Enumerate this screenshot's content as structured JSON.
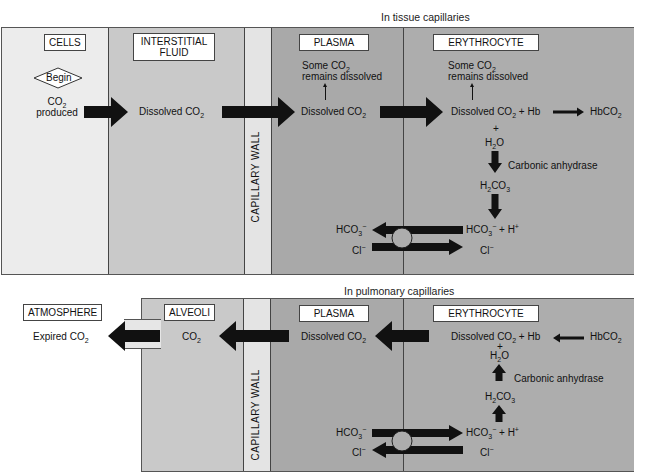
{
  "tissue": {
    "caption": "In tissue capillaries",
    "columns": {
      "cells": "CELLS",
      "interstitial_line1": "INTERSTITIAL",
      "interstitial_line2": "FLUID",
      "wall": "CAPILLARY WALL",
      "plasma": "PLASMA",
      "erythrocyte": "ERYTHROCYTE"
    },
    "begin": "Begin",
    "co2_produced_line1": "CO",
    "co2_produced_sub": "2",
    "co2_produced_line2": "produced",
    "interstitial_text": "Dissolved CO",
    "interstitial_sub": "2",
    "plasma_note_line1": "Some CO",
    "plasma_note_sub": "2",
    "plasma_note_line2": "remains dissolved",
    "plasma_text": "Dissolved CO",
    "plasma_sub": "2",
    "ery_note_line1": "Some CO",
    "ery_note_sub": "2",
    "ery_note_line2": "remains dissolved",
    "ery_reaction_a": "Dissolved CO",
    "ery_reaction_sub": "2",
    "ery_reaction_b": " + Hb",
    "hbco2": "HbCO",
    "hbco2_sub": "2",
    "plus": "+",
    "h2o_a": "H",
    "h2o_sub": "2",
    "h2o_b": "O",
    "enzyme": "Carbonic anhydrase",
    "h2co3_a": "H",
    "h2co3_sub1": "2",
    "h2co3_b": "CO",
    "h2co3_sub2": "3",
    "hco3_ery_a": "HCO",
    "hco3_ery_sub": "3",
    "hco3_ery_sup": "−",
    "hplus": " + H",
    "hplus_sup": "+",
    "hco3_plasma_a": "HCO",
    "hco3_plasma_sub": "3",
    "hco3_plasma_sup": "−",
    "cl_plasma": "Cl",
    "cl_plasma_sup": "−",
    "cl_ery": "Cl",
    "cl_ery_sup": "−"
  },
  "pulmonary": {
    "caption": "In pulmonary capillaries",
    "columns": {
      "atmosphere": "ATMOSPHERE",
      "alveoli": "ALVEOLI",
      "wall": "CAPILLARY WALL",
      "plasma": "PLASMA",
      "erythrocyte": "ERYTHROCYTE"
    },
    "expired": "Expired CO",
    "expired_sub": "2",
    "alveoli_text": "CO",
    "alveoli_sub": "2",
    "plasma_text": "Dissolved CO",
    "plasma_sub": "2",
    "ery_reaction_a": "Dissolved CO",
    "ery_reaction_sub": "2",
    "ery_reaction_b": " + Hb",
    "hbco2": "HbCO",
    "hbco2_sub": "2",
    "plus": "+",
    "h2o_a": "H",
    "h2o_sub": "2",
    "h2o_b": "O",
    "enzyme": "Carbonic anhydrase",
    "h2co3_a": "H",
    "h2co3_sub1": "2",
    "h2co3_b": "CO",
    "h2co3_sub2": "3",
    "hco3_ery_a": "HCO",
    "hco3_ery_sub": "3",
    "hco3_ery_sup": "−",
    "hplus": " + H",
    "hplus_sup": "+",
    "hco3_plasma_a": "HCO",
    "hco3_plasma_sub": "3",
    "hco3_plasma_sup": "−",
    "cl_plasma": "Cl",
    "cl_plasma_sup": "−",
    "cl_ery": "Cl",
    "cl_ery_sup": "−"
  },
  "colors": {
    "cells": "#ececec",
    "interstitial": "#c9c9c9",
    "wall": "#e4e4e4",
    "plasma": "#a9a9a9",
    "erythrocyte": "#adadad",
    "arrow": "#111111"
  }
}
